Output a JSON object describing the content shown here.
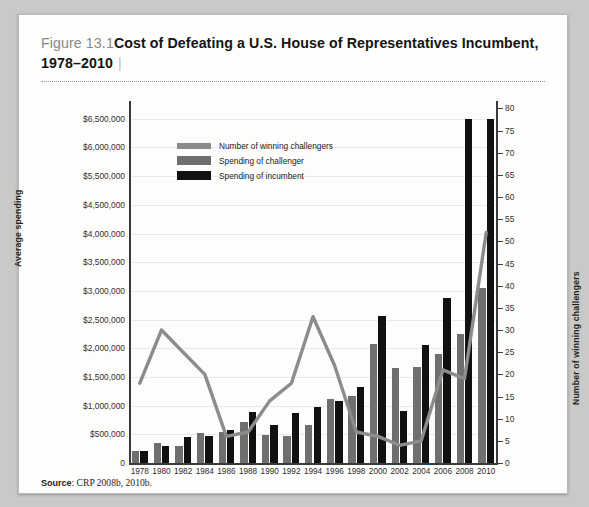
{
  "figure": {
    "number": "Figure 13.1",
    "separator": "|",
    "title": "Cost of Defeating a U.S. House of Representatives Incumbent, 1978–2010"
  },
  "source": {
    "label": "Source",
    "colon": ":",
    "text": "CRP 2008b, 2010b."
  },
  "legend": {
    "position": "inside-top-left",
    "items": [
      {
        "key": "line",
        "label": "Number of winning challengers",
        "color": "#8c8c8a"
      },
      {
        "key": "challenger",
        "label": "Spending of challenger",
        "color": "#6f6f6d"
      },
      {
        "key": "incumbent",
        "label": "Spending of incumbent",
        "color": "#111111"
      }
    ]
  },
  "chart_data": {
    "type": "bar",
    "title": "Cost of Defeating a U.S. House of Representatives Incumbent, 1978–2010",
    "xlabel": "",
    "ylabel": "Average spending",
    "y2label": "Number of winning challengers",
    "grid": true,
    "categories": [
      "1978",
      "1980",
      "1982",
      "1984",
      "1986",
      "1988",
      "1990",
      "1992",
      "1994",
      "1996",
      "1998",
      "2000",
      "2002",
      "2004",
      "2006",
      "2008",
      "2010"
    ],
    "ylim": [
      0,
      6500000
    ],
    "ytick_labels": [
      "0",
      "$500,000",
      "$1,000,000",
      "$1,500,000",
      "$2,000,000",
      "$2,500,000",
      "$3,000,000",
      "$3,500,000",
      "$4,000,000",
      "$4,500,000",
      "$5,500,000",
      "$6,000,000",
      "$6,500,000"
    ],
    "ytick_values": [
      0,
      500000,
      1000000,
      1500000,
      2000000,
      2500000,
      3000000,
      3500000,
      4000000,
      4500000,
      5000000,
      5500000,
      6000000
    ],
    "ytick_note": "Printed axis labels skip $5,000,000; the label reading $5,500,000 sits on the 10th gridline and $6,000,000 / $6,500,000 follow.",
    "y2lim": [
      0,
      80
    ],
    "y2tick_values": [
      0,
      5,
      10,
      15,
      20,
      25,
      30,
      35,
      40,
      45,
      50,
      55,
      60,
      65,
      70,
      75,
      80
    ],
    "series": [
      {
        "name": "Spending of challenger",
        "type": "bar",
        "axis": "left",
        "color": "#6f6f6d",
        "values": [
          215000,
          345000,
          300000,
          520000,
          540000,
          715000,
          480000,
          465000,
          670000,
          1115000,
          1165000,
          2070000,
          1655000,
          1670000,
          1895000,
          2250000,
          3045000
        ]
      },
      {
        "name": "Spending of incumbent",
        "type": "bar",
        "axis": "left",
        "color": "#111111",
        "values": [
          205000,
          290000,
          455000,
          475000,
          575000,
          890000,
          655000,
          875000,
          985000,
          1080000,
          1330000,
          2560000,
          905000,
          2065000,
          2875000,
          6050000,
          6390000
        ]
      },
      {
        "name": "Number of winning challengers",
        "type": "line",
        "axis": "right",
        "color": "#8c8c8a",
        "values": [
          18,
          30,
          25,
          20,
          6,
          7,
          14,
          18,
          33,
          22,
          7,
          6,
          4,
          5,
          21,
          19,
          52
        ]
      }
    ]
  }
}
